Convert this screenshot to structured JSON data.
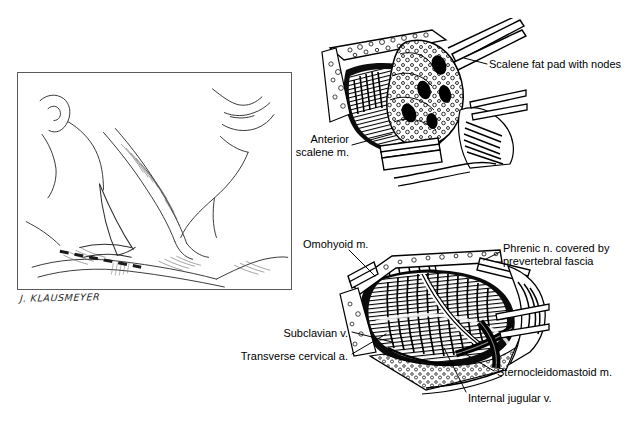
{
  "plate": {
    "title": "Scalene node biopsy — surgical anatomy plate",
    "background_color": "#ffffff",
    "ink_color": "#000000",
    "frame_color": "#5a5a5a",
    "width": 637,
    "height": 421
  },
  "artist": {
    "signature": "J. KLAUSMEYER"
  },
  "orientation_panel": {
    "name": "Surface anatomy of the neck with planned incision",
    "incision_marking": "dashed supraclavicular incision line"
  },
  "panels": [
    {
      "id": "upper",
      "name": "Scalene fat pad exposure",
      "description": "Retracted surgical field showing scalene fat pad elevated with forceps"
    },
    {
      "id": "lower",
      "name": "Deep scalene dissection",
      "description": "Surgical field after fat pad removal showing anterior scalene muscle and phrenic nerve"
    }
  ],
  "labels": [
    {
      "id": "scalene-fat-pad",
      "text": "Scalene fat pad with nodes",
      "panel": "upper",
      "align": "left"
    },
    {
      "id": "anterior-scalene",
      "text": "Anterior\nscalene m.",
      "panel": "upper",
      "align": "right"
    },
    {
      "id": "omohyoid",
      "text": "Omohyoid m.",
      "panel": "lower",
      "align": "left"
    },
    {
      "id": "phrenic",
      "text": "Phrenic n. covered by\nprevertebral fascia",
      "panel": "lower",
      "align": "left"
    },
    {
      "id": "subclavian",
      "text": "Subclavian v.",
      "panel": "lower",
      "align": "right"
    },
    {
      "id": "transverse-cervical",
      "text": "Transverse cervical a.",
      "panel": "lower",
      "align": "right"
    },
    {
      "id": "sternocleidomastoid",
      "text": "Sternocleidomastoid m.",
      "panel": "lower",
      "align": "left"
    },
    {
      "id": "internal-jugular",
      "text": "Internal jugular v.",
      "panel": "lower",
      "align": "left"
    }
  ]
}
